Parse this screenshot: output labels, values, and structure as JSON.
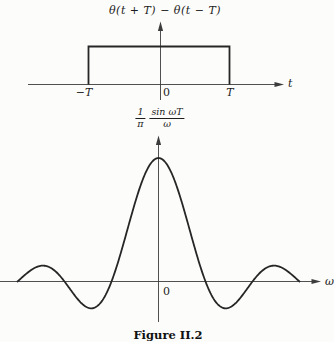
{
  "figure": {
    "caption": "Figure II.2",
    "background": "#fcfcfa",
    "line_color": "#262626",
    "axis_color": "#3c3c3c"
  },
  "top_plot": {
    "title": "θ(t + T) − θ(t − T)",
    "x_axis_label": "t",
    "ticks": {
      "left": "−T",
      "origin": "0",
      "right": "T"
    }
  },
  "bottom_plot": {
    "y_axis_label": {
      "num1": "1",
      "den1": "π",
      "num2": "sin ωT",
      "den2": "ω"
    },
    "x_axis_label": "ω",
    "origin_label": "0"
  },
  "chart_data": [
    {
      "type": "line",
      "title": "θ(t + T) − θ(t − T)",
      "xlabel": "t",
      "ylabel": "",
      "x_ticks": [
        "−T",
        "0",
        "T"
      ],
      "description": "Rectangular pulse: value 1 for −T < t < T, value 0 elsewhere",
      "categories": [
        "t < −T",
        "−T < t < T",
        "t > T"
      ],
      "values": [
        0,
        1,
        0
      ],
      "ylim": [
        0,
        1
      ],
      "grid": false,
      "legend": false
    },
    {
      "type": "line",
      "title": "(1/π)·sin(ωT)/ω",
      "xlabel": "ω",
      "ylabel": "(1/π)·sin(ωT)/ω",
      "x_ticks": [
        "0"
      ],
      "description": "Sinc curve: peak T/π at ω = 0, zeros at ω = ±π/T, ±2π/T, ±3π/T; first minima ≈ −0.217·peak; second maxima ≈ +0.128·peak; drawn over −3π/T ≤ ω ≤ 3π/T",
      "peak": "T/π",
      "zeros": [
        "±π/T",
        "±2π/T",
        "±3π/T"
      ],
      "x_range": [
        "−3π/T",
        "3π/T"
      ],
      "grid": false,
      "legend": false
    }
  ]
}
